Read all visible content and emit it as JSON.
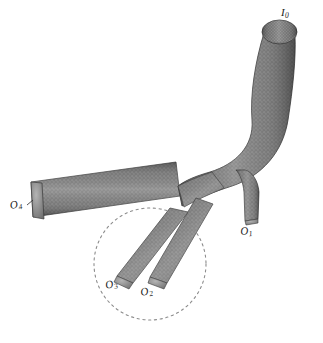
{
  "figure": {
    "background_color": "#ffffff",
    "mesh_color": "#797979",
    "mesh_dark_color": "#4a4a4a",
    "mesh_light_color": "#a8a8a8",
    "outline_color": "#3b3b3b",
    "annotation_color": "#1a1a1a",
    "highlight_circle": {
      "name": "region-of-interest",
      "style": "dashed",
      "color": "#8c8c8c",
      "center_x": 150,
      "center_y": 264,
      "radius": 56
    },
    "labels": [
      {
        "id": "I0",
        "letter": "I",
        "sub": "0",
        "x": 281,
        "y": 7,
        "name": "inlet-label-i0"
      },
      {
        "id": "O1",
        "letter": "O",
        "sub": "1",
        "x": 241,
        "y": 226,
        "name": "outlet-label-o1"
      },
      {
        "id": "O2",
        "letter": "O",
        "sub": "2",
        "x": 142,
        "y": 287,
        "name": "outlet-label-o2"
      },
      {
        "id": "O3",
        "letter": "O",
        "sub": "3",
        "x": 107,
        "y": 280,
        "name": "outlet-label-o3"
      },
      {
        "id": "O4",
        "letter": "O",
        "sub": "4",
        "x": 11,
        "y": 200,
        "name": "outlet-label-o4"
      }
    ],
    "branches": [
      {
        "name": "main-inlet-trunk",
        "id": "I0",
        "role": "inlet"
      },
      {
        "name": "branch-outlet-1",
        "id": "O1",
        "role": "outlet"
      },
      {
        "name": "branch-outlet-2",
        "id": "O2",
        "role": "outlet"
      },
      {
        "name": "branch-outlet-3",
        "id": "O3",
        "role": "outlet"
      },
      {
        "name": "branch-outlet-4",
        "id": "O4",
        "role": "outlet"
      }
    ]
  }
}
